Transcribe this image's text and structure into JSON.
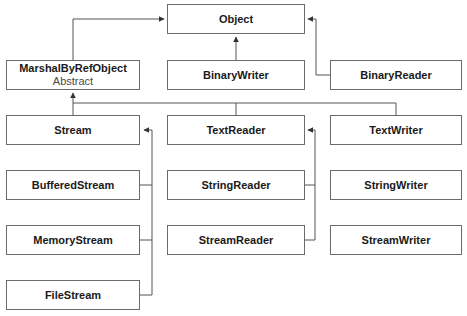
{
  "diagram": {
    "title": "",
    "colors": {
      "line": "#555555",
      "border": "#6b6b6b",
      "text": "#1a1a1a",
      "subtext": "#4a4a4a"
    },
    "nodes": [
      {
        "id": "object",
        "name": "Object"
      },
      {
        "id": "marshal",
        "name": "MarshalByRefObject",
        "sub": "Abstract"
      },
      {
        "id": "binarywriter",
        "name": "BinaryWriter"
      },
      {
        "id": "binaryreader",
        "name": "BinaryReader"
      },
      {
        "id": "stream",
        "name": "Stream"
      },
      {
        "id": "textreader",
        "name": "TextReader"
      },
      {
        "id": "textwriter",
        "name": "TextWriter"
      },
      {
        "id": "bufferedstream",
        "name": "BufferedStream"
      },
      {
        "id": "stringreader",
        "name": "StringReader"
      },
      {
        "id": "stringwriter",
        "name": "StringWriter"
      },
      {
        "id": "memorystream",
        "name": "MemoryStream"
      },
      {
        "id": "streamreader",
        "name": "StreamReader"
      },
      {
        "id": "streamwriter",
        "name": "StreamWriter"
      },
      {
        "id": "filestream",
        "name": "FileStream"
      }
    ],
    "edges": [
      {
        "from": "marshal",
        "to": "object"
      },
      {
        "from": "binarywriter",
        "to": "object"
      },
      {
        "from": "binaryreader",
        "to": "object"
      },
      {
        "from": "stream",
        "to": "marshal"
      },
      {
        "from": "textreader",
        "to": "marshal"
      },
      {
        "from": "textwriter",
        "to": "marshal"
      },
      {
        "from": "bufferedstream",
        "to": "stream"
      },
      {
        "from": "memorystream",
        "to": "stream"
      },
      {
        "from": "filestream",
        "to": "stream"
      },
      {
        "from": "stringreader",
        "to": "textreader"
      },
      {
        "from": "streamreader",
        "to": "textreader"
      }
    ]
  }
}
